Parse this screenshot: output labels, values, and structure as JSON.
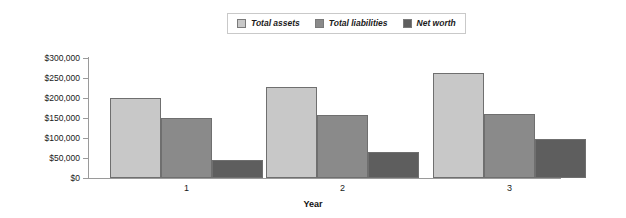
{
  "chart_data": {
    "type": "bar",
    "title": "",
    "xlabel": "Year",
    "ylabel": "",
    "categories": [
      "1",
      "2",
      "3"
    ],
    "series": [
      {
        "name": "Total assets",
        "color": "#c8c8c8",
        "values": [
          200000,
          227500,
          262500
        ]
      },
      {
        "name": "Total liabilities",
        "color": "#8a8a8a",
        "values": [
          150000,
          157500,
          160000
        ]
      },
      {
        "name": "Net worth",
        "color": "#5e5e5e",
        "values": [
          45000,
          65000,
          97500
        ]
      }
    ],
    "ylim": [
      0,
      300000
    ],
    "ytick_step": 50000,
    "ytick_labels": [
      "$300,000",
      "$250,000",
      "$200,000",
      "$150,000",
      "$100,000",
      "$50,000",
      "$0"
    ],
    "ytick_values": [
      300000,
      250000,
      200000,
      150000,
      100000,
      50000,
      0
    ],
    "grid": false,
    "legend_position": "top-center"
  },
  "legend": {
    "entries": [
      {
        "label": "Total assets"
      },
      {
        "label": "Total liabilities"
      },
      {
        "label": "Net worth"
      }
    ]
  },
  "axes": {
    "x_title": "Year"
  }
}
